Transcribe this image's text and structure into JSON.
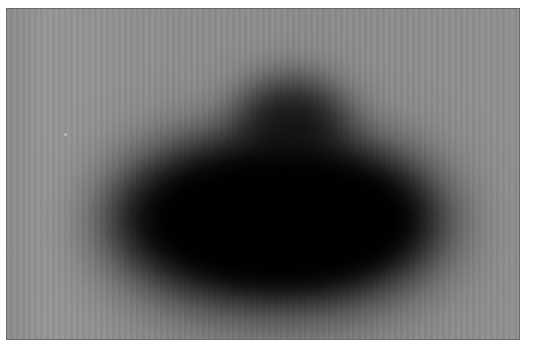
{
  "image": {
    "description": "Grayscale blurred scan showing a large dark oval blot with a smaller lobe on top, on a mid-gray background",
    "colors": {
      "background": "#8c8c8c",
      "blot": "#000000",
      "border": "#6a6a6a",
      "margin": "#ffffff"
    }
  }
}
